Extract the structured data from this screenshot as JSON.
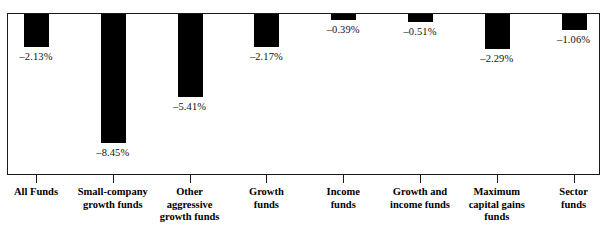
{
  "chart_data": {
    "type": "bar",
    "title": "",
    "subtitle": "",
    "xlabel": "",
    "ylabel": "",
    "orientation": "downward",
    "grid": false,
    "legend": false,
    "axis_line": "top",
    "ylim": [
      -9.0,
      0.0
    ],
    "value_suffix": "%",
    "bar_color": "#000000",
    "frame_color": "#1a1a1a",
    "background": "#ffffff",
    "categories": [
      "All Funds",
      "Small-company growth funds",
      "Other aggressive growth funds",
      "Growth funds",
      "Income funds",
      "Growth and income funds",
      "Maximum capital gains funds",
      "Sector funds"
    ],
    "values": [
      -2.13,
      -8.45,
      -5.41,
      -2.17,
      -0.39,
      -0.51,
      -2.29,
      -1.06
    ],
    "value_labels": [
      "–2.13%",
      "–8.45%",
      "–5.41%",
      "–2.17%",
      "–0.39%",
      "–0.51%",
      "–2.29%",
      "–1.06%"
    ],
    "category_lines": [
      [
        "All Funds"
      ],
      [
        "Small-company",
        "growth funds"
      ],
      [
        "Other",
        "aggressive",
        "growth funds"
      ],
      [
        "Growth",
        "funds"
      ],
      [
        "Income",
        "funds"
      ],
      [
        "Growth and",
        "income funds"
      ],
      [
        "Maximum",
        "capital gains",
        "funds"
      ],
      [
        "Sector",
        "funds"
      ]
    ]
  }
}
